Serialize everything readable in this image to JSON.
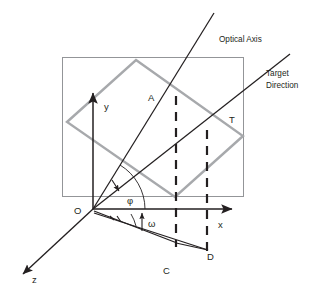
{
  "figure": {
    "background_color": "#ffffff",
    "width": 318,
    "height": 297
  },
  "colors": {
    "dark_line": "#231f20",
    "image_plane_border": "#939598",
    "gray_rect": "#a7a9ac",
    "dashed_line": "#231f20",
    "text": "#231f20"
  },
  "axes": [
    {
      "name": "y-axis",
      "label": "y",
      "label_x": 106,
      "label_y": 108,
      "direction": "up"
    },
    {
      "name": "x-axis",
      "label": "x",
      "label_x": 219,
      "label_y": 227,
      "direction": "right"
    },
    {
      "name": "z-axis",
      "label": "z",
      "label_x": 33,
      "label_y": 281,
      "direction": "lower-left"
    }
  ],
  "points": [
    {
      "name": "origin",
      "label": "O",
      "label_x": 76,
      "label_y": 213,
      "x": 93,
      "y": 209
    },
    {
      "name": "point-a",
      "label": "A",
      "label_x": 149,
      "label_y": 99,
      "x": 176,
      "y": 97
    },
    {
      "name": "point-t",
      "label": "T",
      "label_x": 230,
      "label_y": 121,
      "x": 207,
      "y": 131
    },
    {
      "name": "point-c",
      "label": "C",
      "label_x": 164,
      "label_y": 271,
      "x": 176,
      "y": 243
    },
    {
      "name": "point-d",
      "label": "D",
      "label_x": 208,
      "label_y": 258,
      "x": 207,
      "y": 250
    }
  ],
  "angles": [
    {
      "name": "phi-angle",
      "label": "φ",
      "label_x": 128,
      "label_y": 202,
      "between": [
        "x-axis",
        "optical-axis"
      ]
    },
    {
      "name": "omega-angle",
      "label": "ω",
      "label_x": 149,
      "label_y": 224,
      "between": [
        "OC",
        "OD"
      ]
    }
  ],
  "callouts": [
    {
      "name": "optical-axis-callout",
      "lines": [
        "Optical Axis"
      ],
      "x": 219,
      "y": 40
    },
    {
      "name": "target-direction-callout",
      "lines": [
        "Target",
        "Direction"
      ],
      "x": 266,
      "y": 76
    }
  ],
  "shapes": {
    "image_plane": {
      "name": "image-plane-rectangle",
      "x": 62,
      "y": 57,
      "width": 181,
      "height": 139,
      "stroke": "#939598"
    },
    "tilted_rectangle": {
      "name": "tilted-target-rectangle",
      "points": "136,60 243,136 175,197 67,122",
      "stroke": "#a7a9ac"
    },
    "optical_axis_line": {
      "name": "optical-axis-line",
      "x1": 93,
      "y1": 209,
      "x2": 214,
      "y2": 13
    },
    "target_direction_line": {
      "name": "target-direction-line",
      "x1": 93,
      "y1": 209,
      "x2": 288,
      "y2": 56
    },
    "z_axis_line": {
      "name": "z-axis-line",
      "x1": 93,
      "y1": 209,
      "x2": 20,
      "y2": 277
    },
    "y_axis_line": {
      "name": "y-axis-line",
      "x1": 93,
      "y1": 209,
      "x2": 93,
      "y2": 89
    },
    "x_axis_line": {
      "name": "x-axis-line",
      "x1": 93,
      "y1": 209,
      "x2": 236,
      "y2": 209
    },
    "dashed_lines": [
      {
        "name": "dashed-line-a-c",
        "x": 176,
        "y1": 97,
        "y2": 248
      },
      {
        "name": "dashed-line-t-d",
        "x": 207,
        "y1": 131,
        "y2": 251
      }
    ],
    "ground_triangle": {
      "name": "ground-projection-triangle",
      "o_to_c": {
        "x1": 93,
        "y1": 211,
        "x2": 176,
        "y2": 243
      },
      "o_to_d": {
        "x1": 93,
        "y1": 213,
        "x2": 207,
        "y2": 250
      },
      "c_to_d": {
        "x1": 176,
        "y1": 243,
        "x2": 207,
        "y2": 250
      }
    }
  }
}
